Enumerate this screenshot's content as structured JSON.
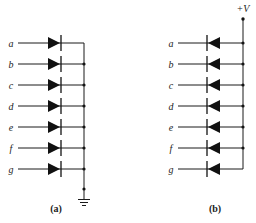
{
  "figure": {
    "panels": [
      {
        "id": "a",
        "caption": "(a)",
        "inputs": [
          "a",
          "b",
          "c",
          "d",
          "e",
          "f",
          "g"
        ],
        "diode_direction": "anode-left (pointing toward bus)",
        "bus_terminal": "ground"
      },
      {
        "id": "b",
        "caption": "(b)",
        "inputs": [
          "a",
          "b",
          "c",
          "d",
          "e",
          "f",
          "g"
        ],
        "diode_direction": "cathode-left (pointing away from bus)",
        "bus_terminal": "+V",
        "supply_label": "+V"
      }
    ]
  },
  "colors": {
    "ink": "#111111",
    "background": "#ffffff"
  }
}
